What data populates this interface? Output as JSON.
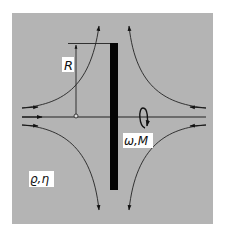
{
  "diagram": {
    "labels": {
      "radius": "R",
      "rotation": "ω,M",
      "fluid": "ϱ,η"
    },
    "colors": {
      "background": "#b4b4b4",
      "page": "#ffffff",
      "ink": "#111111",
      "disc": "#050505",
      "label_bg": "#ffffff"
    },
    "elements": {
      "disc": "rotating disc",
      "axis": "rotation axis",
      "flow_lines": [
        "inflow-upper-left",
        "inflow-lower-left",
        "inflow-upper-right",
        "inflow-lower-right"
      ],
      "radius_marker": "radius dimension",
      "rotation_arrow": "rotation direction"
    }
  }
}
